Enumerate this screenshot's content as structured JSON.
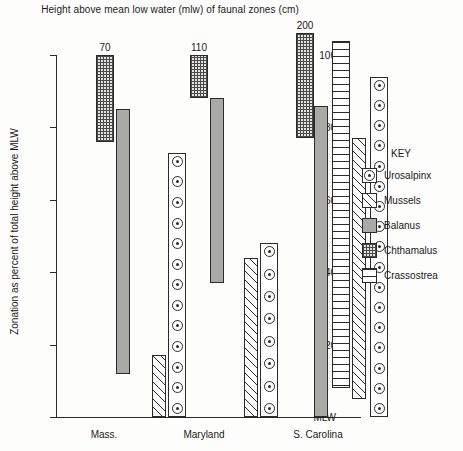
{
  "chart_data": {
    "type": "bar",
    "title": "Height above mean low water (mlw) of faunal zones (cm)",
    "xlabel": "",
    "ylabel": "Zonation as percent of total height above MLW",
    "ylim": [
      0,
      108
    ],
    "grid": false,
    "legend_position": "right",
    "yticks": [
      {
        "value": 100,
        "label": "100"
      },
      {
        "value": 80,
        "label": "80"
      },
      {
        "value": 60,
        "label": "60"
      },
      {
        "value": 40,
        "label": "40"
      },
      {
        "value": 20,
        "label": "20"
      },
      {
        "value": 0,
        "label": "MLW"
      }
    ],
    "categories": [
      "Mass.",
      "Maryland",
      "S. Carolina"
    ],
    "group_annotations": [
      "70",
      "110",
      "200"
    ],
    "series": [
      {
        "name": "Chthamalus",
        "fill": "chthamalus",
        "ranges": [
          {
            "group": "Mass.",
            "bottom": 76,
            "top": 100
          },
          {
            "group": "Maryland",
            "bottom": 88,
            "top": 100
          },
          {
            "group": "S. Carolina",
            "bottom": 77,
            "top": 106
          }
        ]
      },
      {
        "name": "Balanus",
        "fill": "balanus",
        "ranges": [
          {
            "group": "Mass.",
            "bottom": 12,
            "top": 85
          },
          {
            "group": "Maryland",
            "bottom": 37,
            "top": 88
          },
          {
            "group": "S. Carolina",
            "bottom": 0,
            "top": 86
          }
        ]
      },
      {
        "name": "Crassostrea",
        "fill": "crassostrea",
        "ranges": [
          {
            "group": "S. Carolina",
            "bottom": 8,
            "top": 104
          }
        ]
      },
      {
        "name": "Mussels",
        "fill": "mussels",
        "ranges": [
          {
            "group": "Mass.",
            "bottom": 0,
            "top": 17
          },
          {
            "group": "Maryland",
            "bottom": 0,
            "top": 44
          },
          {
            "group": "S. Carolina",
            "bottom": 5,
            "top": 77
          }
        ]
      },
      {
        "name": "Urosalpinx",
        "fill": "urosalpinx",
        "ranges": [
          {
            "group": "Mass.",
            "bottom": 0,
            "top": 73
          },
          {
            "group": "Maryland",
            "bottom": 0,
            "top": 48
          },
          {
            "group": "S. Carolina",
            "bottom": 0,
            "top": 94
          }
        ]
      }
    ]
  },
  "legend": {
    "title": "KEY",
    "items": [
      {
        "label": "Urosalpinx",
        "fill": "urosalpinx"
      },
      {
        "label": "Mussels",
        "fill": "mussels"
      },
      {
        "label": "Balanus",
        "fill": "balanus"
      },
      {
        "label": "Chthamalus",
        "fill": "chthamalus"
      },
      {
        "label": "Crassostrea",
        "fill": "crassostrea"
      }
    ]
  },
  "colors": {
    "axis": "#2b2b2b",
    "balanus": "#a9a9a6",
    "chthamalus": "#e2e2de",
    "background": "#fdfdfb"
  }
}
